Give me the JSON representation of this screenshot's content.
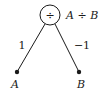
{
  "diagram": {
    "type": "computational-graph",
    "root": {
      "symbol": "÷",
      "expression": "A ÷ B"
    },
    "children": [
      {
        "label": "A",
        "edge_weight": "1"
      },
      {
        "label": "B",
        "edge_weight": "−1"
      }
    ],
    "colors": {
      "stroke": "#1a1a1a",
      "background": "#ffffff"
    }
  }
}
